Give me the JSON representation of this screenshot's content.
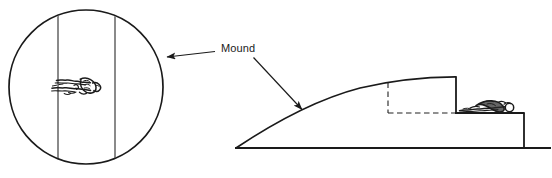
{
  "figure": {
    "background_color": "#ffffff",
    "stroke_color": "#1a1a1a",
    "width": 552,
    "height": 178
  },
  "labels": {
    "mound": "Mound"
  },
  "annotations": [
    {
      "name": "arrow-to-inset",
      "label": "Mound",
      "direction": "left",
      "from": [
        215,
        51
      ],
      "to": [
        166,
        57
      ]
    },
    {
      "name": "arrow-to-mound-slope",
      "label": "Mound",
      "direction": "down-right",
      "from": [
        254,
        58
      ],
      "to": [
        303,
        110
      ]
    }
  ],
  "inset": {
    "name": "circular-detail-view",
    "shape": "circle",
    "center": [
      86,
      87
    ],
    "radius": 77,
    "vertical_lines_x": [
      58,
      115
    ],
    "contents": "sketched-figure"
  },
  "mound": {
    "name": "mound-cross-section",
    "baseline_y": 148,
    "left_tip": [
      236,
      148
    ],
    "right_edge_x": 524,
    "step": {
      "top_y": 77,
      "riser_x": 456,
      "ledge_y": 113,
      "ledge_right_x": 524
    },
    "hidden_outline": {
      "style": "dashed",
      "top_left": [
        388,
        82
      ],
      "bottom_left": [
        388,
        113
      ],
      "bottom_right": [
        456,
        113
      ]
    },
    "figure_on_ledge": "sketched-figure"
  },
  "colors": {
    "stroke": "#1a1a1a",
    "background": "#ffffff",
    "dash": "#222222",
    "text": "#1a1a1a"
  }
}
